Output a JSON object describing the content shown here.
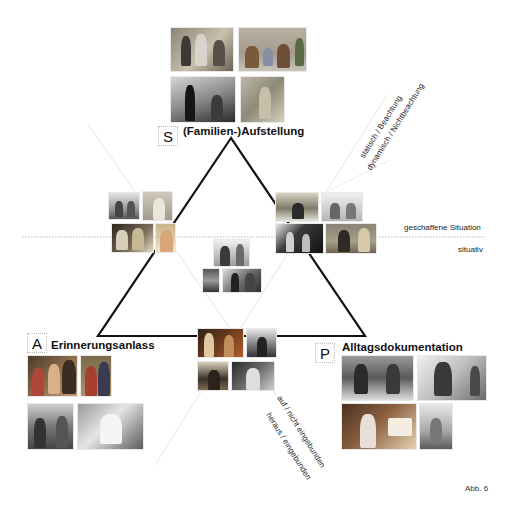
{
  "diagram": {
    "caption": "Abb. 6",
    "poles": [
      {
        "letter": "S",
        "title": "(Familien-)Aufstellung"
      },
      {
        "letter": "A",
        "title": "Erinnerungsanlass"
      },
      {
        "letter": "P",
        "title": "Alltagsdokumentation"
      }
    ],
    "axes": {
      "top_right_upper": "statisch / Beachtung",
      "top_right_lower": "dynamisch / Nichtbeachtung",
      "horizontal_upper": "geschaffene Situation",
      "horizontal_lower": "situativ",
      "bottom_upper": "auf / nicht eingebunden",
      "bottom_lower": "heraus / eingebunden"
    },
    "photo_groups": [
      {
        "id": "S",
        "count": 4,
        "tone": "color"
      },
      {
        "id": "left-mid",
        "count": 4,
        "tone": "mixed"
      },
      {
        "id": "right-mid",
        "count": 4,
        "tone": "mixed"
      },
      {
        "id": "center",
        "count": 3,
        "tone": "bw"
      },
      {
        "id": "bottom-center",
        "count": 4,
        "tone": "mixed"
      },
      {
        "id": "A",
        "count": 4,
        "tone": "mixed"
      },
      {
        "id": "P",
        "count": 4,
        "tone": "mixed"
      }
    ],
    "colors": {
      "triangle": "#111111",
      "guide_lines": "#e2e2e2",
      "dotted_line": "#b0b0b0"
    }
  }
}
